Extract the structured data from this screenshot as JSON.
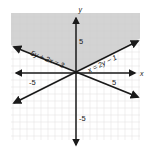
{
  "figure": {
    "type": "coordinate-plane-inequality-graph",
    "background": "#ffffff",
    "shade_color": "#c9c9c9",
    "grid_color": "#e3e1e1",
    "axis_color": "#1a1a1a",
    "line_color": "#1a1a1a"
  },
  "axes": {
    "x_axis_label": "x",
    "y_axis_label": "y",
    "x_ticks": [
      {
        "label": "-5",
        "value": -5
      },
      {
        "label": "5",
        "value": 5
      }
    ],
    "y_ticks": [
      {
        "label": "5",
        "value": 5
      },
      {
        "label": "-5",
        "value": -5
      }
    ],
    "xlim": [
      -9,
      9
    ],
    "ylim": [
      -8,
      8
    ],
    "grid": true
  },
  "lines": [
    {
      "name": "line-5y-plus-2x-equals-3",
      "label": "5y + 2x = 3",
      "equation": "5y + 2x = 3",
      "slope": -0.4,
      "intercept": 0.6,
      "style": "solid",
      "label_rotation": -22
    },
    {
      "name": "line-x-equals-2y-minus-1",
      "label": "x = 2y − 1",
      "equation": "x = 2y − 1",
      "slope": 0.5,
      "intercept": 0.5,
      "style": "solid",
      "label_rotation": -27
    }
  ],
  "shaded_region": {
    "name": "solution-region",
    "description": "Region above both lines"
  }
}
